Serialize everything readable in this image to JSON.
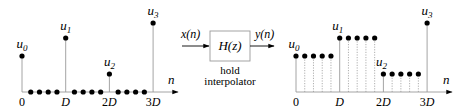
{
  "left_plot": {
    "axis_label": "n",
    "tick_labels": [
      "0",
      "D",
      "2D",
      "3D"
    ],
    "samples": [
      {
        "label": "u",
        "sub": "0",
        "level": 56
      },
      {
        "label": "u",
        "sub": "1",
        "level": 38
      },
      {
        "label": "u",
        "sub": "2",
        "level": 74
      },
      {
        "label": "u",
        "sub": "3",
        "level": 23
      }
    ],
    "zeros_between": 4
  },
  "block": {
    "input_label": "x(n)",
    "output_label": "y(n)",
    "transfer_function": "H(z)",
    "caption_line1": "hold",
    "caption_line2": "interpolator"
  },
  "right_plot": {
    "axis_label": "n",
    "tick_labels": [
      "0",
      "D",
      "2D",
      "3D"
    ],
    "samples": [
      {
        "label": "u",
        "sub": "0",
        "level": 56
      },
      {
        "label": "u",
        "sub": "1",
        "level": 38
      },
      {
        "label": "u",
        "sub": "2",
        "level": 74
      },
      {
        "label": "u",
        "sub": "3",
        "level": 23
      }
    ],
    "hold_count": 5
  },
  "colors": {
    "ink": "#000000",
    "stem": "#9a9a9a",
    "dotted": "#9a9a9a"
  }
}
